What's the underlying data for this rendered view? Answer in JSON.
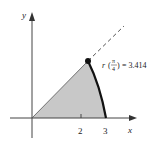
{
  "diagram": {
    "axes": {
      "x_label": "x",
      "y_label": "y",
      "x_ticks": [
        {
          "value": 2,
          "label": "2"
        },
        {
          "value": 3,
          "label": "3"
        }
      ]
    },
    "point_annotation": {
      "lhs_func": "r",
      "frac_num": "π",
      "frac_den": "4",
      "equals": "= 3.414"
    },
    "colors": {
      "shaded_region": "#c8c8c8",
      "axes": "#444444",
      "curve": "#111111",
      "dashed_ray": "#555555"
    }
  }
}
